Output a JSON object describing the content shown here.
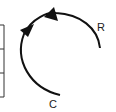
{
  "diagram": {
    "labels": {
      "r": "R",
      "c": "C"
    },
    "colors": {
      "stroke": "#111111",
      "box": "#333333",
      "background": "#ffffff"
    },
    "arc": {
      "direction": "counterclockwise-to-clockwise path from C up and around to R",
      "arrowheads": 2
    },
    "side_box": {
      "rows": 3
    }
  }
}
